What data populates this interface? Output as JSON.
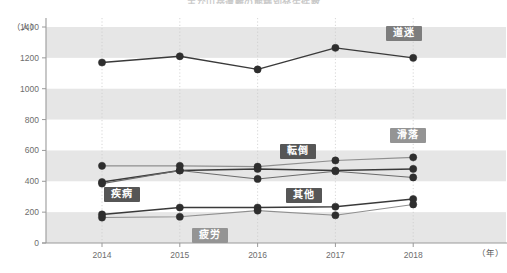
{
  "title": "主な山岳遭難の態様別発生件数",
  "axes": {
    "y_unit": "（人）",
    "x_unit": "（年）",
    "y_ticks": [
      "0",
      "200",
      "400",
      "600",
      "800",
      "1000",
      "1200",
      "1400"
    ],
    "x_ticks": [
      "2014",
      "2015",
      "2016",
      "2017",
      "2018"
    ]
  },
  "series_labels": {
    "michimayoi": "道迷",
    "kakuraku": "滑落",
    "tentou": "転倒",
    "shippei": "疾病",
    "sonota": "其他",
    "hirou": "疲労"
  },
  "colors": {
    "line_dark": "#3a3a3a",
    "line_mid": "#6b6b6b",
    "line_light": "#8f8f8f",
    "band": "#e6e6e6",
    "axis": "#9a9a9a",
    "grid": "#cccccc",
    "tag_dark": "#565656",
    "tag_mid": "#6e6e6e",
    "tag_light": "#949494"
  },
  "chart_data": {
    "type": "line",
    "title": "主な山岳遭難の態様別発生件数",
    "xlabel": "（年）",
    "ylabel": "（人）",
    "x": [
      "2014",
      "2015",
      "2016",
      "2017",
      "2018"
    ],
    "ylim": [
      0,
      1400
    ],
    "ytick_step": 200,
    "grid": "horizontal-bands + vertical-dotted",
    "legend": "inline-labels",
    "series": [
      {
        "name": "道迷",
        "values": [
          1170,
          1210,
          1125,
          1265,
          1200
        ],
        "style": "dark"
      },
      {
        "name": "転倒",
        "values": [
          500,
          500,
          495,
          535,
          555
        ],
        "style": "light"
      },
      {
        "name": "滑落",
        "values": [
          395,
          470,
          480,
          470,
          480
        ],
        "style": "dark"
      },
      {
        "name": "疾病",
        "values": [
          385,
          470,
          415,
          465,
          425
        ],
        "style": "mid"
      },
      {
        "name": "其他",
        "values": [
          185,
          230,
          230,
          235,
          285
        ],
        "style": "dark"
      },
      {
        "name": "疲労",
        "values": [
          165,
          170,
          210,
          180,
          250
        ],
        "style": "light"
      }
    ]
  }
}
